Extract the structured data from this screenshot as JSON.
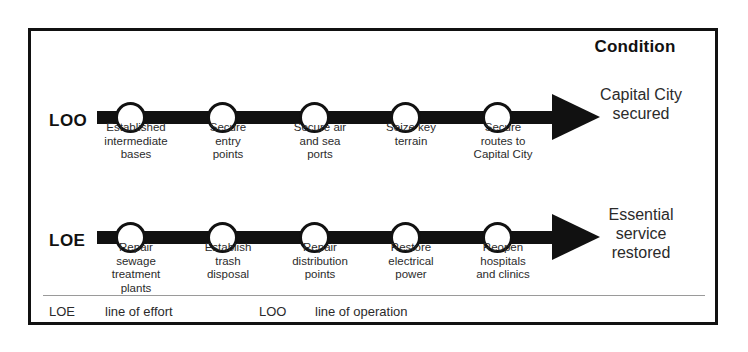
{
  "header": {
    "condition_title": "Condition"
  },
  "rows": [
    {
      "id": "loo",
      "label": "LOO",
      "nodes": [
        {
          "lines": [
            "Established",
            "intermediate",
            "bases"
          ]
        },
        {
          "lines": [
            "Secure",
            "entry",
            "points"
          ]
        },
        {
          "lines": [
            "Secure air",
            "and sea",
            "ports"
          ]
        },
        {
          "lines": [
            "Seize key",
            "terrain"
          ]
        },
        {
          "lines": [
            "Secure",
            "routes to",
            "Capital City"
          ]
        }
      ],
      "condition": [
        "Capital City",
        "secured"
      ]
    },
    {
      "id": "loe",
      "label": "LOE",
      "nodes": [
        {
          "lines": [
            "Repair",
            "sewage",
            "treatment",
            "plants"
          ]
        },
        {
          "lines": [
            "Establish",
            "trash",
            "disposal"
          ]
        },
        {
          "lines": [
            "Repair",
            "distribution",
            "points"
          ]
        },
        {
          "lines": [
            "Restore",
            "electrical",
            "power"
          ]
        },
        {
          "lines": [
            "Reopen",
            "hospitals",
            "and clinics"
          ]
        }
      ],
      "condition": [
        "Essential",
        "service",
        "restored"
      ]
    }
  ],
  "legend": [
    {
      "abbr": "LOE",
      "term": "line of effort"
    },
    {
      "abbr": "LOO",
      "term": "line of operation"
    }
  ],
  "colors": {
    "ink": "#111111",
    "text": "#2b2b2b",
    "background": "#ffffff",
    "divider": "#9a9a9a"
  }
}
